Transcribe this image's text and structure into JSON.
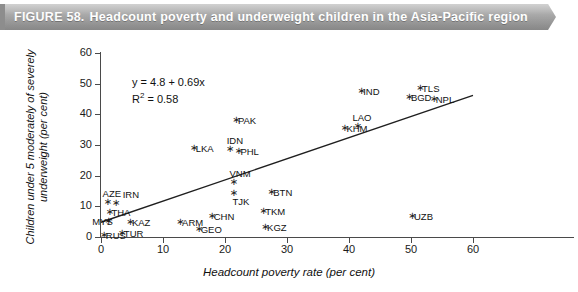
{
  "banner": {
    "figure_number": "FIGURE 58.",
    "title": "Headcount poverty and underweight children in the Asia-Pacific region",
    "background_color": "#a8a8a8",
    "text_color": "#ffffff"
  },
  "annotation": {
    "equation": "y = 4.8 + 0.69x",
    "r_squared_label": "R",
    "r_squared_exponent": "2",
    "r_squared_value": "= 0.58"
  },
  "chart_data": {
    "type": "scatter",
    "title": "Headcount poverty and underweight children in the Asia-Pacific region",
    "xlabel": "Headcount poverty rate (per cent)",
    "ylabel": "Children under 5 moderately of severely underweight (per cent)",
    "xlim": [
      0,
      60
    ],
    "ylim": [
      0,
      60
    ],
    "xticks": [
      0,
      10,
      20,
      30,
      40,
      50,
      60
    ],
    "yticks": [
      0,
      10,
      20,
      30,
      40,
      50,
      60
    ],
    "grid": false,
    "legend": "none",
    "trendline": {
      "equation": "y = 4.8 + 0.69x",
      "intercept": 4.8,
      "slope": 0.69,
      "r_squared": 0.58,
      "x_start": 0,
      "x_end": 60
    },
    "points": [
      {
        "label": "RUS",
        "x": 0.3,
        "y": 0.6,
        "lx": 3,
        "ly": -4
      },
      {
        "label": "TUR",
        "x": 3.2,
        "y": 1.3,
        "lx": 3,
        "ly": -4
      },
      {
        "label": "MYS",
        "x": 1.0,
        "y": 5.3,
        "lx": -15,
        "ly": -4
      },
      {
        "label": "KAZ",
        "x": 4.5,
        "y": 4.8,
        "lx": 3,
        "ly": -4
      },
      {
        "label": "THA",
        "x": 1.2,
        "y": 8.2,
        "lx": 3,
        "ly": -4
      },
      {
        "label": "AZE",
        "x": 0.9,
        "y": 11.3,
        "lx": -4,
        "ly": -13
      },
      {
        "label": "IRN",
        "x": 2.2,
        "y": 11.2,
        "lx": 8,
        "ly": -13
      },
      {
        "label": "GEO",
        "x": 15.6,
        "y": 2.6,
        "lx": 3,
        "ly": -4
      },
      {
        "label": "ARM",
        "x": 12.6,
        "y": 4.9,
        "lx": 3,
        "ly": -4
      },
      {
        "label": "CHN",
        "x": 17.7,
        "y": 6.8,
        "lx": 3,
        "ly": -4
      },
      {
        "label": "KGZ",
        "x": 26.3,
        "y": 3.3,
        "lx": 3,
        "ly": -4
      },
      {
        "label": "TKM",
        "x": 26.0,
        "y": 8.5,
        "lx": 3,
        "ly": -4
      },
      {
        "label": "TJK",
        "x": 21.2,
        "y": 14.3,
        "lx": 0,
        "ly": 4
      },
      {
        "label": "VNM",
        "x": 21.2,
        "y": 18.0,
        "lx": -3,
        "ly": -13
      },
      {
        "label": "BTN",
        "x": 27.3,
        "y": 14.8,
        "lx": 3,
        "ly": -4
      },
      {
        "label": "PHL",
        "x": 22.0,
        "y": 28.0,
        "lx": 3,
        "ly": -4
      },
      {
        "label": "IDN",
        "x": 20.6,
        "y": 28.6,
        "lx": -2,
        "ly": -13
      },
      {
        "label": "LKA",
        "x": 14.8,
        "y": 29.0,
        "lx": 3,
        "ly": -4
      },
      {
        "label": "PAK",
        "x": 21.6,
        "y": 38.0,
        "lx": 3,
        "ly": -4
      },
      {
        "label": "UZB",
        "x": 50.0,
        "y": 6.9,
        "lx": 3,
        "ly": -4
      },
      {
        "label": "KHM",
        "x": 39.1,
        "y": 35.7,
        "lx": 3,
        "ly": -4
      },
      {
        "label": "LAO",
        "x": 41.2,
        "y": 36.2,
        "lx": -4,
        "ly": -13
      },
      {
        "label": "IND",
        "x": 41.8,
        "y": 47.6,
        "lx": 3,
        "ly": -4
      },
      {
        "label": "BGD",
        "x": 49.5,
        "y": 45.6,
        "lx": 3,
        "ly": -4
      },
      {
        "label": "TLS",
        "x": 51.3,
        "y": 48.6,
        "lx": 3,
        "ly": -4
      },
      {
        "label": "NPL",
        "x": 53.5,
        "y": 45.0,
        "lx": 3,
        "ly": -4
      }
    ]
  }
}
